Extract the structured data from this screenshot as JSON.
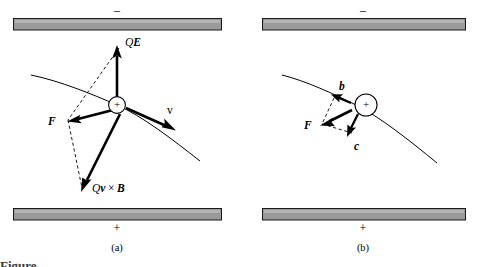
{
  "figure": {
    "background_color": "#ffffff",
    "ink_color": "#000000",
    "plate_fill": "#9a9a9a",
    "plate_stroke": "#1a1a1a",
    "caption_sliver": "Figure"
  },
  "panel_a": {
    "caption": "(a)",
    "top_plate_sign": "–",
    "bottom_plate_sign": "+",
    "charge_symbol": "+",
    "vectors": [
      {
        "key": "qe",
        "label_parts": {
          "scalar": "Q",
          "vector": "E"
        },
        "label_text": "QE",
        "direction": "up",
        "style": "solid"
      },
      {
        "key": "force",
        "label_parts": {
          "scalar": "",
          "vector": "F"
        },
        "label_text": "F",
        "direction": "left-slightly-down",
        "style": "solid"
      },
      {
        "key": "velocity",
        "label_parts": {
          "scalar": "",
          "vector": "v"
        },
        "label_text": "v",
        "direction": "right-down",
        "style": "solid"
      },
      {
        "key": "qvxb",
        "label_parts": {
          "scalar": "Q",
          "vector": "v",
          "operator": "×",
          "vector2": "B"
        },
        "label_text": "Qv × B",
        "direction": "down-left",
        "style": "solid"
      }
    ],
    "construction_lines": "dashed parallelogram from QE tip and Qv×B tip to F tip"
  },
  "panel_b": {
    "caption": "(b)",
    "top_plate_sign": "–",
    "bottom_plate_sign": "+",
    "charge_symbol": "+",
    "vectors": [
      {
        "key": "b",
        "label_parts": {
          "scalar": "",
          "vector": "b"
        },
        "label_text": "b",
        "direction": "up-left",
        "style": "solid"
      },
      {
        "key": "force",
        "label_parts": {
          "scalar": "",
          "vector": "F"
        },
        "label_text": "F",
        "direction": "left-down",
        "style": "solid"
      },
      {
        "key": "c",
        "label_parts": {
          "scalar": "",
          "vector": "c"
        },
        "label_text": "c",
        "direction": "down-left",
        "style": "solid"
      }
    ],
    "construction_lines": "dashed parallelogram from b tip and c tip to F tip"
  }
}
